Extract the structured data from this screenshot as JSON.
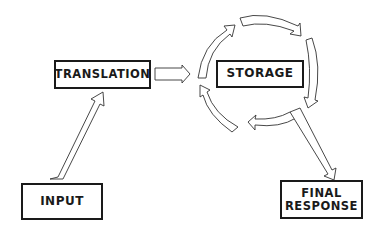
{
  "diagram": {
    "nodes": {
      "translation": {
        "label": "TRANSLATION"
      },
      "storage": {
        "label": "STORAGE"
      },
      "input": {
        "label": "INPUT"
      },
      "final_response": {
        "line1": "FINAL",
        "line2": "RESPONSE"
      }
    },
    "edges": [
      {
        "from": "INPUT",
        "to": "TRANSLATION"
      },
      {
        "from": "TRANSLATION",
        "to": "STORAGE"
      },
      {
        "from": "STORAGE",
        "to": "STORAGE",
        "style": "cycle"
      },
      {
        "from": "STORAGE",
        "to": "FINAL RESPONSE"
      }
    ],
    "colors": {
      "stroke": "#1a1a1a",
      "fill": "#ffffff"
    }
  }
}
